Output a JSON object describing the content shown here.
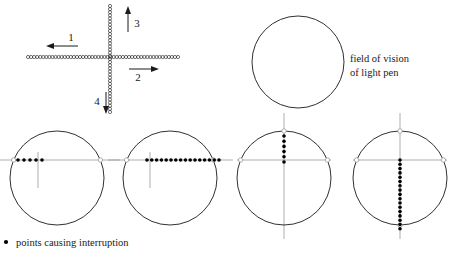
{
  "figure": {
    "title_absent": true,
    "annotation": {
      "line1": "field of vision",
      "line2": "of light pen"
    },
    "caption": {
      "bullet": "•",
      "text": "points causing interruption"
    },
    "direction_labels": [
      {
        "id": "1",
        "label": "1",
        "direction": "left"
      },
      {
        "id": "2",
        "label": "2",
        "direction": "right"
      },
      {
        "id": "3",
        "label": "3",
        "direction": "up"
      },
      {
        "id": "4",
        "label": "4",
        "direction": "down"
      }
    ],
    "colors": {
      "stroke": "#1a1a1a",
      "thin_line": "#9a9a9a",
      "dot_fill": "#000000",
      "background": "#ffffff"
    },
    "cross_pattern": {
      "description": "chain of small open circles forming a cross",
      "horizontal": {
        "x_start": 28,
        "x_end": 178,
        "y": 57,
        "bead_count": 50
      },
      "vertical": {
        "y_start": 6,
        "y_end": 112,
        "x": 110,
        "bead_count": 35
      },
      "bead_radius": 1.6
    },
    "field_circle": {
      "cx": 298,
      "cy": 62,
      "r": 46
    },
    "bottom_circles": [
      {
        "name": "case-1",
        "cx": 57,
        "cy": 178,
        "r": 47,
        "line_orientation": "horizontal",
        "dot_count": 5,
        "dot_start": 18,
        "dot_step": 6,
        "tick": {
          "x": 38,
          "y_top": 152,
          "y_bottom": 188
        }
      },
      {
        "name": "case-2",
        "cx": 170,
        "cy": 178,
        "r": 47,
        "line_orientation": "horizontal",
        "dot_count": 16,
        "dot_start": 147,
        "dot_step": 4.8,
        "tick": {
          "x": 150,
          "y_top": 152,
          "y_bottom": 188
        }
      },
      {
        "name": "case-3",
        "cx": 284,
        "cy": 178,
        "r": 47,
        "line_orientation": "vertical",
        "dot_count": 6,
        "dot_start": 136,
        "dot_step": 5.2,
        "tick": {
          "y": 160,
          "x_left": 237,
          "x_right": 331
        }
      },
      {
        "name": "case-4",
        "cx": 400,
        "cy": 178,
        "r": 47,
        "line_orientation": "vertical",
        "dot_count": 17,
        "dot_start": 160,
        "dot_step": 4.3,
        "tick": {
          "y": 160,
          "x_left": 353,
          "x_right": 447
        }
      }
    ]
  }
}
